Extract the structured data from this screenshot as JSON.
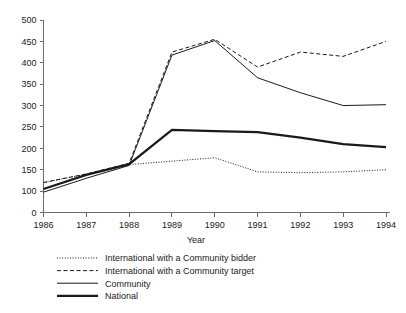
{
  "chart_data": {
    "type": "line",
    "title": "",
    "subtitle": "",
    "xlabel": "Year",
    "ylabel": "",
    "x": [
      1986,
      1987,
      1988,
      1989,
      1990,
      1991,
      1992,
      1993,
      1994
    ],
    "categories": [
      "1986",
      "1987",
      "1988",
      "1989",
      "1990",
      "1991",
      "1992",
      "1993",
      "1994"
    ],
    "xtick_labels": [
      "1986",
      "1987",
      "1988",
      "1989",
      "1990",
      "1991",
      "1992",
      "1993",
      "1994"
    ],
    "ytick_labels": [
      "0",
      "100",
      "150",
      "200",
      "250",
      "300",
      "350",
      "400",
      "450",
      "500"
    ],
    "ytick_values": [
      0,
      100,
      150,
      200,
      250,
      300,
      350,
      400,
      450,
      500
    ],
    "ylim": [
      0,
      500
    ],
    "xlim": [
      1986,
      1994
    ],
    "axis_break": "y-axis compressed between 0 and 100",
    "grid": false,
    "legend_position": "below-plot-left",
    "axes_drawn": "left and bottom only",
    "series": [
      {
        "name": "International with a Community bidder",
        "style": "dotted",
        "line_width": 1,
        "color": "#1a1a1a",
        "values": [
          120,
          140,
          162,
          170,
          178,
          145,
          143,
          145,
          150
        ]
      },
      {
        "name": "International with a Community target",
        "style": "dashed",
        "line_width": 1,
        "color": "#1a1a1a",
        "values": [
          120,
          140,
          165,
          425,
          455,
          390,
          425,
          415,
          450
        ]
      },
      {
        "name": "Community",
        "style": "solid-thin",
        "line_width": 1,
        "color": "#1a1a1a",
        "values": [
          95,
          130,
          160,
          418,
          452,
          365,
          330,
          300,
          302
        ]
      },
      {
        "name": "National",
        "style": "solid-thick",
        "line_width": 2.2,
        "color": "#1a1a1a",
        "values": [
          105,
          138,
          163,
          243,
          240,
          238,
          225,
          210,
          203
        ]
      }
    ]
  },
  "legend": {
    "items": [
      {
        "label": "International with a Community bidder",
        "style": "dotted"
      },
      {
        "label": "International with a Community target",
        "style": "dashed"
      },
      {
        "label": "Community",
        "style": "solid-thin"
      },
      {
        "label": "National",
        "style": "solid-thick"
      }
    ]
  }
}
